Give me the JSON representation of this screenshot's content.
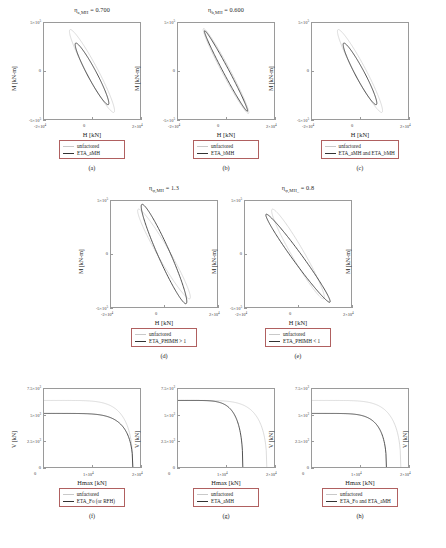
{
  "figure": {
    "colors": {
      "unfactored_line": "#c9c9c9",
      "eta_line": "#333333",
      "axis": "#9a9a9a",
      "legend_border": "#b06060"
    }
  },
  "common": {
    "legend_unfactored": "unfactored",
    "axis_H": "H [kN]",
    "axis_M": "M [kN-m]",
    "axis_Hmax": "Hmax [kN]",
    "axis_V": "V [kN]"
  },
  "panels": [
    {
      "id": "a",
      "label": "(a)",
      "title_symbol": "η",
      "title_sub": "a,MH",
      "title_rest": " = 0.700",
      "xlabel": "H [kN]",
      "ylabel": "M [kN-m]",
      "ylabel_right": "M [kN-m]",
      "xticks": [
        "-2×10",
        "0",
        "2×10"
      ],
      "xtick_exps": [
        "4",
        "",
        "4"
      ],
      "yticks": [
        "5×10",
        "0",
        "-5×10"
      ],
      "ytick_exps": [
        "5",
        "",
        "5"
      ],
      "legend": [
        "unfactored",
        "ETA_aMH"
      ]
    },
    {
      "id": "b",
      "label": "(b)",
      "title_symbol": "η",
      "title_sub": "b,MH",
      "title_rest": " = 0.600",
      "xlabel": "H [kN]",
      "ylabel": "",
      "ylabel_right": "M [kN-m]",
      "xticks": [
        "-2×10",
        "0",
        "2×10"
      ],
      "xtick_exps": [
        "4",
        "",
        "4"
      ],
      "yticks": [
        "5×10",
        "0",
        "-5×10"
      ],
      "ytick_exps": [
        "5",
        "",
        "5"
      ],
      "legend": [
        "unfactored",
        "ETA_bMH"
      ]
    },
    {
      "id": "c",
      "label": "(c)",
      "title_symbol": "",
      "title_sub": "",
      "title_rest": "",
      "xlabel": "H [kN]",
      "ylabel": "",
      "ylabel_right": "",
      "xticks": [
        "-2×10",
        "0",
        "2×10"
      ],
      "xtick_exps": [
        "4",
        "",
        "4"
      ],
      "yticks": [
        "5×10",
        "0",
        "-5×10"
      ],
      "ytick_exps": [
        "5",
        "",
        "5"
      ],
      "legend": [
        "unfactored",
        "ETA_aMH and ETA_bMH"
      ]
    },
    {
      "id": "d",
      "label": "(d)",
      "title_symbol": "η",
      "title_sub": "φ,MH",
      "title_rest": " = 1.3",
      "xlabel": "H [kN]",
      "ylabel": "M [kN-m]",
      "ylabel_right": "M [kN-m]",
      "xticks": [
        "-2×10",
        "0",
        "2×10"
      ],
      "xtick_exps": [
        "4",
        "",
        "4"
      ],
      "yticks": [
        "5×10",
        "0",
        "-5×10"
      ],
      "ytick_exps": [
        "5",
        "",
        "5"
      ],
      "legend": [
        "unfactored",
        "ETA_PHIMH > 1"
      ]
    },
    {
      "id": "e",
      "label": "(e)",
      "title_symbol": "η",
      "title_sub": "φ,MH_",
      "title_rest": " = 0.8",
      "xlabel": "H [kN]",
      "ylabel": "",
      "ylabel_right": "M [kN-m]",
      "xticks": [
        "-2×10",
        "0",
        "2×10"
      ],
      "xtick_exps": [
        "4",
        "",
        "4"
      ],
      "yticks": [
        "5×10",
        "0",
        "-5×10"
      ],
      "ytick_exps": [
        "5",
        "",
        "5"
      ],
      "legend": [
        "unfactored",
        "ETA_PHIMH < 1"
      ]
    },
    {
      "id": "f",
      "label": "(f)",
      "title_symbol": "",
      "title_sub": "",
      "title_rest": "",
      "xlabel": "Hmax [kN]",
      "ylabel": "V [kN]",
      "ylabel_right": "V [kN]",
      "xticks": [
        "0",
        "1×10",
        "2×10"
      ],
      "xtick_exps": [
        "",
        "4",
        "4"
      ],
      "yticks": [
        "7.5×10",
        "5×10",
        "2.5×10",
        "0"
      ],
      "ytick_exps": [
        "3",
        "3",
        "3",
        ""
      ],
      "legend": [
        "unfactored",
        "ETA_Fo (or RFH)"
      ]
    },
    {
      "id": "g",
      "label": "(g)",
      "title_symbol": "",
      "title_sub": "",
      "title_rest": "",
      "xlabel": "Hmax [kN]",
      "ylabel": "",
      "ylabel_right": "V [kN]",
      "xticks": [
        "0",
        "1×10",
        "2×10"
      ],
      "xtick_exps": [
        "",
        "4",
        "4"
      ],
      "yticks": [
        "7.5×10",
        "5×10",
        "2.5×10",
        "0"
      ],
      "ytick_exps": [
        "3",
        "3",
        "3",
        ""
      ],
      "legend": [
        "unfactored",
        "ETA_aMH"
      ]
    },
    {
      "id": "h",
      "label": "(h)",
      "title_symbol": "",
      "title_sub": "",
      "title_rest": "",
      "xlabel": "Hmax [kN]",
      "ylabel": "",
      "ylabel_right": "V [kN]",
      "xticks": [
        "0",
        "1×10",
        "2×10"
      ],
      "xtick_exps": [
        "",
        "4",
        "4"
      ],
      "yticks": [
        "7.5×10",
        "5×10",
        "2.5×10",
        "0"
      ],
      "ytick_exps": [
        "3",
        "3",
        "3",
        ""
      ],
      "legend": [
        "unfactored",
        "ETA_Fo and ETA_aMH"
      ]
    }
  ],
  "chart_data": [
    {
      "type": "line",
      "panel": "a",
      "title": "ηa,MH = 0.700",
      "xlabel": "H [kN]",
      "ylabel": "M [kN-m]",
      "xlim": [
        -20000,
        20000
      ],
      "ylim": [
        -500000,
        500000
      ],
      "grid": false,
      "series": [
        {
          "name": "unfactored",
          "shape": "ellipse",
          "cx": 0,
          "cy": 0,
          "semi_major": 19500,
          "semi_minor": 2400,
          "angle_deg": -62,
          "color": "#c9c9c9"
        },
        {
          "name": "ETA_aMH",
          "shape": "ellipse",
          "cx": 0,
          "cy": -30000,
          "semi_major": 14500,
          "semi_minor": 1900,
          "angle_deg": -62,
          "color": "#333333"
        }
      ]
    },
    {
      "type": "line",
      "panel": "b",
      "title": "ηb,MH = 0.600",
      "xlabel": "H [kN]",
      "ylabel": "M [kN-m]",
      "xlim": [
        -20000,
        20000
      ],
      "ylim": [
        -500000,
        500000
      ],
      "grid": false,
      "series": [
        {
          "name": "unfactored",
          "shape": "ellipse",
          "cx": 0,
          "cy": 0,
          "semi_major": 20000,
          "semi_minor": 1700,
          "angle_deg": -62,
          "color": "#c9c9c9"
        },
        {
          "name": "ETA_bMH",
          "shape": "ellipse",
          "cx": 0,
          "cy": 0,
          "semi_major": 19000,
          "semi_minor": 1200,
          "angle_deg": -62,
          "color": "#333333"
        }
      ]
    },
    {
      "type": "line",
      "panel": "c",
      "title": "",
      "xlabel": "H [kN]",
      "ylabel": "M [kN-m]",
      "xlim": [
        -20000,
        20000
      ],
      "ylim": [
        -500000,
        500000
      ],
      "grid": false,
      "series": [
        {
          "name": "unfactored",
          "shape": "ellipse",
          "cx": 0,
          "cy": 0,
          "semi_major": 19500,
          "semi_minor": 2400,
          "angle_deg": -62,
          "color": "#c9c9c9"
        },
        {
          "name": "ETA_aMH and ETA_bMH",
          "shape": "ellipse",
          "cx": 0,
          "cy": -30000,
          "semi_major": 14500,
          "semi_minor": 1900,
          "angle_deg": -62,
          "color": "#333333"
        }
      ]
    },
    {
      "type": "line",
      "panel": "d",
      "title": "ηφ,MH = 1.3",
      "xlabel": "H [kN]",
      "ylabel": "M [kN-m]",
      "xlim": [
        -20000,
        20000
      ],
      "ylim": [
        -500000,
        500000
      ],
      "grid": false,
      "series": [
        {
          "name": "unfactored",
          "shape": "ellipse",
          "cx": 0,
          "cy": 0,
          "semi_major": 19500,
          "semi_minor": 2300,
          "angle_deg": -60,
          "color": "#c9c9c9"
        },
        {
          "name": "ETA_PHIMH > 1",
          "shape": "ellipse",
          "cx": 0,
          "cy": 0,
          "semi_major": 20500,
          "semi_minor": 2300,
          "angle_deg": -66,
          "color": "#333333"
        }
      ]
    },
    {
      "type": "line",
      "panel": "e",
      "title": "ηφ,MH_ = 0.8",
      "xlabel": "H [kN]",
      "ylabel": "M [kN-m]",
      "xlim": [
        -20000,
        20000
      ],
      "ylim": [
        -500000,
        500000
      ],
      "grid": false,
      "series": [
        {
          "name": "unfactored",
          "shape": "ellipse",
          "cx": 0,
          "cy": 0,
          "semi_major": 19500,
          "semi_minor": 2300,
          "angle_deg": -60,
          "color": "#c9c9c9"
        },
        {
          "name": "ETA_PHIMH < 1",
          "shape": "ellipse",
          "cx": 0,
          "cy": -40000,
          "semi_major": 20500,
          "semi_minor": 1800,
          "angle_deg": -54,
          "color": "#333333"
        }
      ]
    },
    {
      "type": "line",
      "panel": "f",
      "title": "",
      "xlabel": "Hmax [kN]",
      "ylabel": "V [kN]",
      "xlim": [
        0,
        20000
      ],
      "ylim": [
        0,
        7500
      ],
      "grid": false,
      "series": [
        {
          "name": "unfactored",
          "plateau_V": 6400,
          "cutoff_H": 18500,
          "color": "#c9c9c9"
        },
        {
          "name": "ETA_Fo (or RFH)",
          "plateau_V": 5150,
          "cutoff_H": 18500,
          "color": "#333333"
        }
      ]
    },
    {
      "type": "line",
      "panel": "g",
      "title": "",
      "xlabel": "Hmax [kN]",
      "ylabel": "V [kN]",
      "xlim": [
        0,
        20000
      ],
      "ylim": [
        0,
        7500
      ],
      "grid": false,
      "series": [
        {
          "name": "unfactored",
          "plateau_V": 6400,
          "cutoff_H": 18500,
          "color": "#c9c9c9"
        },
        {
          "name": "ETA_aMH",
          "plateau_V": 6400,
          "cutoff_H": 13500,
          "color": "#333333"
        }
      ]
    },
    {
      "type": "line",
      "panel": "h",
      "title": "",
      "xlabel": "Hmax [kN]",
      "ylabel": "V [kN]",
      "xlim": [
        0,
        20000
      ],
      "ylim": [
        0,
        7500
      ],
      "grid": false,
      "series": [
        {
          "name": "unfactored",
          "plateau_V": 6400,
          "cutoff_H": 18500,
          "color": "#c9c9c9"
        },
        {
          "name": "ETA_Fo and ETA_aMH",
          "plateau_V": 5150,
          "cutoff_H": 15500,
          "color": "#333333"
        }
      ]
    }
  ]
}
